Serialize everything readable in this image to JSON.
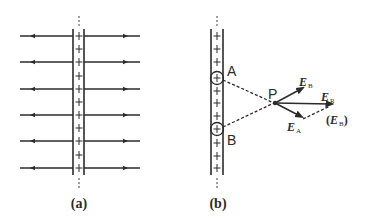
{
  "figure": {
    "panel_a": {
      "caption": "(a)",
      "plus_sign": "+",
      "field_line_count": 6,
      "plus_count": 11
    },
    "panel_b": {
      "caption": "(b)",
      "plus_sign": "+",
      "point_a_label": "A",
      "point_b_label": "B",
      "point_p_label": "P",
      "vector_eb": {
        "symbol": "E",
        "subscript": "B"
      },
      "vector_ea": {
        "symbol": "E",
        "subscript": "A"
      },
      "vector_er": {
        "symbol": "E",
        "subscript": "R"
      },
      "vector_eb_translated": {
        "open": "(",
        "symbol": "E",
        "subscript": "B",
        "close": ")"
      }
    }
  },
  "colors": {
    "line": "#2b2b2b",
    "background": "#ffffff"
  }
}
